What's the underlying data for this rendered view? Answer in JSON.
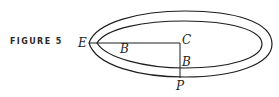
{
  "figure": {
    "caption": "FIGURE 5",
    "labels": {
      "E": "E",
      "B_horizontal": "B",
      "C": "C",
      "B_vertical": "B",
      "P": "P"
    }
  },
  "colors": {
    "stroke": "#1e1e1e",
    "background": "#ffffff"
  }
}
